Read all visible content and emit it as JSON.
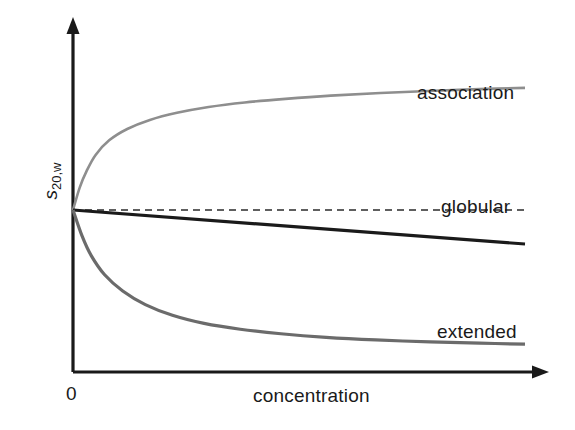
{
  "chart_data": {
    "type": "line",
    "title": "",
    "subtitle": "",
    "xlabel": "concentration",
    "ylabel": "s20,w",
    "ylabel_symbol": "s",
    "ylabel_subscript": "20,w",
    "x_tick_labels": [
      "0"
    ],
    "y_tick_labels": [],
    "xlim": [
      0,
      100
    ],
    "ylim": [
      0,
      100
    ],
    "grid": false,
    "legend": "inline-labels-at-curve-ends",
    "axes_style": "two-arrow-axes-no-ticks",
    "annotations": [
      {
        "text": "association",
        "x": 77,
        "y": 81
      },
      {
        "text": "globular",
        "x": 82,
        "y": 55
      },
      {
        "text": "extended",
        "x": 81,
        "y": 21
      }
    ],
    "series": [
      {
        "name": "association",
        "color": "#8e8e8e",
        "style": "solid",
        "width": 2.6,
        "points": [
          [
            0,
            50
          ],
          [
            1.5,
            57
          ],
          [
            3,
            62
          ],
          [
            5,
            67
          ],
          [
            8,
            71.5
          ],
          [
            12,
            75
          ],
          [
            17,
            77.8
          ],
          [
            23,
            80
          ],
          [
            30,
            81.8
          ],
          [
            38,
            83.2
          ],
          [
            47,
            84.3
          ],
          [
            57,
            85.3
          ],
          [
            68,
            86.1
          ],
          [
            80,
            86.8
          ],
          [
            90,
            87.3
          ],
          [
            100,
            87.7
          ]
        ]
      },
      {
        "name": "ideal-reference",
        "color": "#2b2b2b",
        "style": "dashed",
        "width": 1.6,
        "points": [
          [
            0,
            50
          ],
          [
            100,
            50
          ]
        ]
      },
      {
        "name": "globular",
        "color": "#1a1a1a",
        "style": "solid",
        "width": 3.2,
        "points": [
          [
            0,
            50
          ],
          [
            100,
            39.5
          ]
        ]
      },
      {
        "name": "extended",
        "color": "#6b6b6b",
        "style": "solid",
        "width": 3.2,
        "points": [
          [
            0,
            50
          ],
          [
            2,
            42
          ],
          [
            4,
            36
          ],
          [
            7,
            30
          ],
          [
            11,
            25
          ],
          [
            16,
            20.8
          ],
          [
            22,
            17.5
          ],
          [
            29,
            15
          ],
          [
            37,
            13.2
          ],
          [
            46,
            11.8
          ],
          [
            56,
            10.7
          ],
          [
            67,
            9.9
          ],
          [
            79,
            9.3
          ],
          [
            90,
            8.9
          ],
          [
            100,
            8.6
          ]
        ]
      }
    ]
  },
  "figure": {
    "background": "#ffffff",
    "axis_color": "#1a1a1a",
    "text_color": "#1a1a1a"
  }
}
